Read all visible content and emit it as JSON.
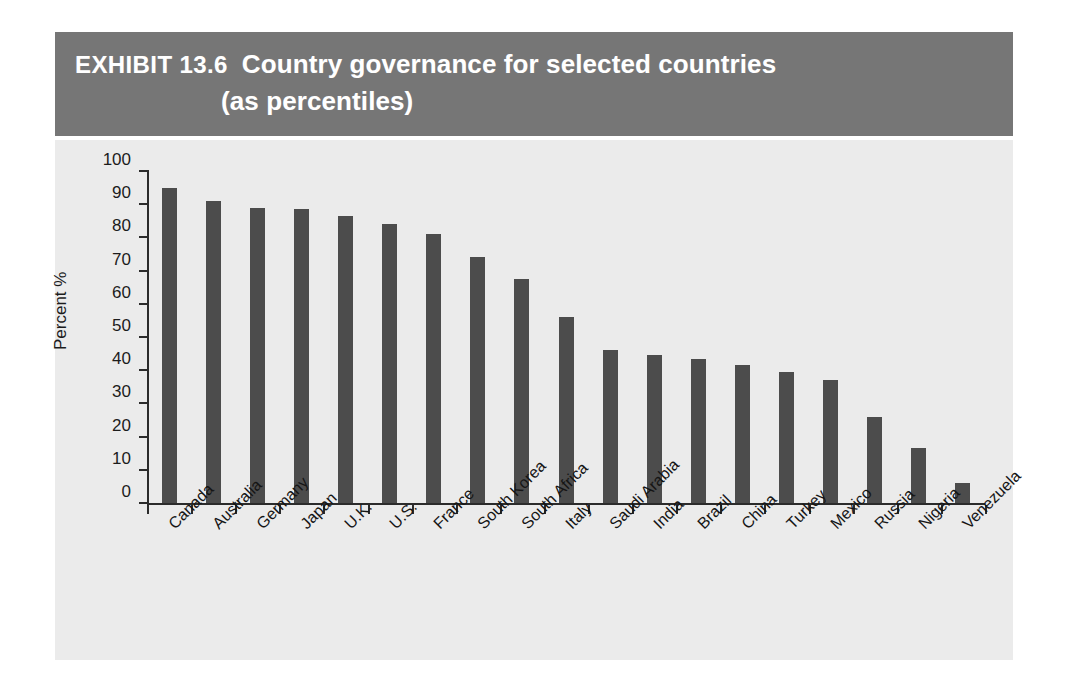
{
  "header": {
    "exhibit_number": "EXHIBIT 13.6",
    "title": "Country governance for selected countries",
    "subtitle": "(as percentiles)",
    "band_color": "#767676",
    "text_color": "#ffffff"
  },
  "panel": {
    "background_color": "#ebebeb"
  },
  "chart_data": {
    "type": "bar",
    "title": "Country governance for selected countries (as percentiles)",
    "xlabel": "",
    "ylabel": "Percent %",
    "ylim": [
      0,
      100
    ],
    "ytick_step": 10,
    "yticks": [
      0,
      10,
      20,
      30,
      40,
      50,
      60,
      70,
      80,
      90,
      100
    ],
    "ytick_labels": [
      "0",
      "10",
      "20",
      "30",
      "40",
      "50",
      "60",
      "70",
      "80",
      "90",
      "100"
    ],
    "grid": false,
    "legend": null,
    "bar_color": "#4c4c4c",
    "axis_color": "#2b2b2b",
    "categories": [
      "Canada",
      "Australia",
      "Germany",
      "Japan",
      "U.K.",
      "U.S.",
      "France",
      "South Korea",
      "South Africa",
      "Italy",
      "Saudi Arabia",
      "India",
      "Brazil",
      "China",
      "Turkey",
      "Mexico",
      "Russia",
      "Nigeria",
      "Venezuela"
    ],
    "values": [
      95,
      91,
      89,
      88.5,
      86.5,
      84,
      81,
      74,
      67.5,
      56,
      46,
      44.5,
      43.5,
      41.5,
      39.5,
      37,
      26,
      16.5,
      6
    ]
  }
}
